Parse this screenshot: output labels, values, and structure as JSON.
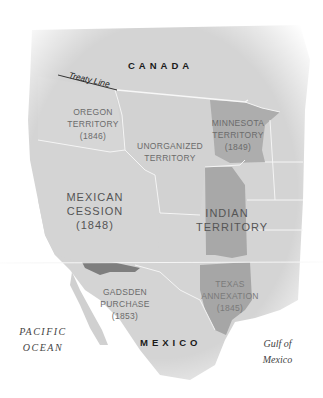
{
  "map": {
    "colors": {
      "land": "#d2d2d2",
      "land_light": "#dcdcdc",
      "highlight_dark": "#a9a9a9",
      "borders": "#f4f4f4",
      "water": "#ffffff"
    },
    "countries": {
      "canada": "CANADA",
      "mexico": "MEXICO"
    },
    "treaty_line": "Treaty Line",
    "territories": [
      {
        "name": "OREGON",
        "line2": "TERRITORY",
        "year": "(1846)"
      },
      {
        "name": "UNORGANIZED",
        "line2": "TERRITORY"
      },
      {
        "name": "MINNESOTA",
        "line2": "TERRITORY",
        "year": "(1849)"
      },
      {
        "name": "MEXICAN",
        "line2": "CESSION",
        "year": "(1848)"
      },
      {
        "name": "INDIAN",
        "line2": "TERRITORY"
      },
      {
        "name": "GADSDEN",
        "line2": "PURCHASE",
        "year": "(1853)"
      },
      {
        "name": "TEXAS",
        "line2": "ANNEXATION",
        "year": "(1845)"
      }
    ],
    "water_bodies": {
      "pacific_line1": "PACIFIC",
      "pacific_line2": "OCEAN",
      "gulf_line1": "Gulf of",
      "gulf_line2": "Mexico"
    }
  }
}
